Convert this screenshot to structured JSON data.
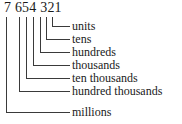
{
  "diagram": {
    "number_display": "7 654 321",
    "digits": [
      "7",
      "6",
      "5",
      "4",
      "3",
      "2",
      "1"
    ],
    "line_color": "#3a3a3a",
    "text_color": "#1a1a1a",
    "background_color": "#ffffff",
    "places": [
      {
        "digit": "1",
        "label": "units",
        "value": 1,
        "elbow_x": 52,
        "elbow_y": 26
      },
      {
        "digit": "2",
        "label": "tens",
        "value": 20,
        "elbow_x": 46,
        "elbow_y": 39
      },
      {
        "digit": "3",
        "label": "hundreds",
        "value": 300,
        "elbow_x": 40,
        "elbow_y": 52
      },
      {
        "digit": "4",
        "label": "thousands",
        "value": 4000,
        "elbow_x": 33,
        "elbow_y": 65
      },
      {
        "digit": "5",
        "label": "ten thousands",
        "value": 50000,
        "elbow_x": 26,
        "elbow_y": 78
      },
      {
        "digit": "6",
        "label": "hundred thousands",
        "value": 600000,
        "elbow_x": 19,
        "elbow_y": 91
      },
      {
        "digit": "7",
        "label": "millions",
        "value": 7000000,
        "elbow_x": 6,
        "elbow_y": 112
      }
    ]
  }
}
